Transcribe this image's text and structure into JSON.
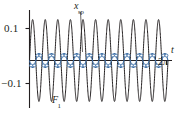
{
  "figure": {
    "title": "",
    "background_color": "#ffffff",
    "width": 182,
    "height": 113
  },
  "labels": {
    "y_top": "0.1",
    "y_bottom": "−0.1",
    "x_axis": "t",
    "x_tick_end": "2",
    "x_tick_end_symbol": "π",
    "curve_blue": "x",
    "curve_blue_sub": "sp",
    "curve_black": "F",
    "curve_black_sub": "1"
  },
  "colors": {
    "curve_black": "#231f20",
    "curve_blue": "#3c6ea6",
    "marker_fill": "#ffffff",
    "axis": "#231f20",
    "text": "#231f20"
  },
  "chart_data": {
    "type": "line",
    "title": "",
    "xlabel": "t",
    "ylabel": "",
    "xlim": [
      0,
      6.2832
    ],
    "ylim": [
      -0.155,
      0.155
    ],
    "grid": false,
    "legend": "none",
    "xticks": [
      6.2832
    ],
    "xticklabels": [
      "2π"
    ],
    "yticks": [
      0.1,
      -0.1
    ],
    "yticklabels": [
      "0.1",
      "−0.1"
    ],
    "annotations": [
      {
        "text": "x_sp",
        "x": 2.45,
        "y": 0.175,
        "points_to": [
          2.28,
          0.02
        ]
      },
      {
        "text": "F_1",
        "x": 1.22,
        "y": -0.175
      }
    ],
    "series": [
      {
        "name": "F_1",
        "label": "F₁",
        "color": "#231f20",
        "type": "line",
        "markers": false,
        "amplitude": 0.128,
        "cycles": 11,
        "phase": 0.0,
        "description": "Large-amplitude fast sinusoid, 11 cycles over 0 to 2π, amplitude 0.128"
      },
      {
        "name": "x_sp",
        "label": "xₛₚ",
        "color": "#3c6ea6",
        "type": "line",
        "markers": true,
        "marker_shape": "circle",
        "marker_count": 44,
        "amplitude": 0.022,
        "cycles": 11,
        "phase": 3.14159,
        "description": "Small-amplitude sinusoid about zero, 11 cycles over 0 to 2π, amplitude 0.022, open circle markers"
      }
    ]
  }
}
